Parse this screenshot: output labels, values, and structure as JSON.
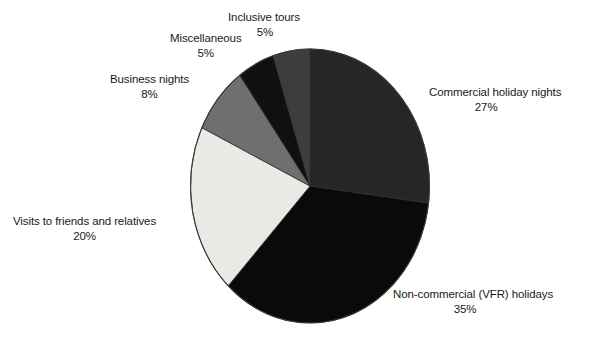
{
  "chart_data": {
    "type": "pie",
    "title": "",
    "subtitle": "",
    "xlabel": "",
    "ylabel": "",
    "legend_position": "none",
    "grid": false,
    "units": "percent",
    "start_angle_deg": 0,
    "direction": "clockwise",
    "categories": [
      "Commercial holiday nights",
      "Non-commercial (VFR) holidays",
      "Visits to friends and relatives",
      "Business nights",
      "Miscellaneous",
      "Inclusive tours"
    ],
    "values": [
      27,
      35,
      20,
      8,
      5,
      5
    ],
    "colors": [
      "#262626",
      "#0a0a0a",
      "#e9e9e6",
      "#6f6f6f",
      "#101010",
      "#3d3d3d"
    ],
    "slices": [
      {
        "label": "Commercial holiday nights",
        "value": 27,
        "value_text": "27%",
        "color": "#262626",
        "start_deg": 0,
        "end_deg": 97.2
      },
      {
        "label": "Non-commercial (VFR) holidays",
        "value": 35,
        "value_text": "35%",
        "color": "#0a0a0a",
        "start_deg": 97.2,
        "end_deg": 223.2
      },
      {
        "label": "Visits to friends and relatives",
        "value": 20,
        "value_text": "20%",
        "color": "#e9e9e6",
        "start_deg": 223.2,
        "end_deg": 295.2
      },
      {
        "label": "Business nights",
        "value": 8,
        "value_text": "8%",
        "color": "#6f6f6f",
        "start_deg": 295.2,
        "end_deg": 324.0
      },
      {
        "label": "Miscellaneous",
        "value": 5,
        "value_text": "5%",
        "color": "#101010",
        "start_deg": 324.0,
        "end_deg": 342.0
      },
      {
        "label": "Inclusive tours",
        "value": 5,
        "value_text": "5%",
        "color": "#3d3d3d",
        "start_deg": 342.0,
        "end_deg": 360.0
      }
    ]
  },
  "labels": {
    "commercial": {
      "name": "Commercial holiday nights",
      "value": "27%"
    },
    "noncommercial": {
      "name": "Non-commercial (VFR) holidays",
      "value": "35%"
    },
    "visits": {
      "name": "Visits to friends and relatives",
      "value": "20%"
    },
    "business": {
      "name": "Business nights",
      "value": "8%"
    },
    "miscellaneous": {
      "name": "Miscellaneous",
      "value": "5%"
    },
    "inclusive": {
      "name": "Inclusive tours",
      "value": "5%"
    }
  }
}
